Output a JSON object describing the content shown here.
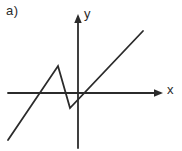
{
  "figure": {
    "sub_label": "a)",
    "background_color": "#ffffff",
    "ink_color": "#2b2b2b",
    "stroke_width": 1.8
  },
  "axes": {
    "x_axis_label": "x",
    "y_axis_label": "y",
    "origin": {
      "x": 78,
      "y": 93
    },
    "x_axis": {
      "x1": 8,
      "y1": 93,
      "x2": 163,
      "y2": 93,
      "arrow": "right"
    },
    "y_axis": {
      "x1": 78,
      "y1": 148,
      "x2": 78,
      "y2": 14,
      "arrow": "up"
    },
    "arrow_head_size": 6,
    "ticks": [],
    "grid": false
  },
  "chart_data": {
    "type": "line",
    "title": "",
    "xlabel": "x",
    "ylabel": "y",
    "grid": false,
    "legend": null,
    "axis_origin_px": {
      "x": 78,
      "y": 93
    },
    "pixel_points": [
      {
        "x": 8,
        "y": 140
      },
      {
        "x": 58,
        "y": 66
      },
      {
        "x": 70,
        "y": 108
      },
      {
        "x": 143,
        "y": 31
      }
    ],
    "polyline_px": "8,140 58,66 70,108 143,31",
    "annotations": [
      {
        "text": "a)",
        "x": 6,
        "y": 3
      },
      {
        "text": "y",
        "x": 84,
        "y": 6
      },
      {
        "text": "x",
        "x": 167,
        "y": 82
      }
    ],
    "series": [
      {
        "name": "piecewise-linear-curve",
        "points": [
          {
            "x": -5.8,
            "y": -3.9
          },
          {
            "x": -1.7,
            "y": 2.3
          },
          {
            "x": -0.7,
            "y": -1.3
          },
          {
            "x": 5.4,
            "y": 5.2
          }
        ]
      }
    ],
    "xlim": [
      -5.8,
      7.1
    ],
    "ylim": [
      -4.6,
      6.6
    ]
  }
}
